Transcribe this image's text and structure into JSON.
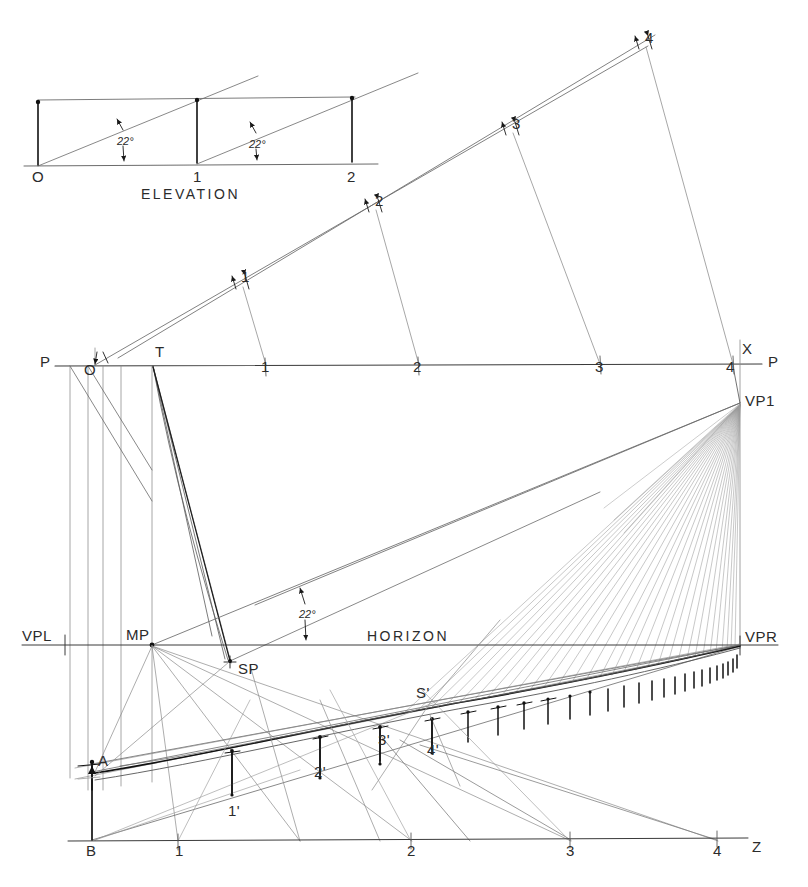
{
  "drawing": {
    "title": "Perspective construction – inclined plane",
    "line_color": "#3a3a3a",
    "heavy_color": "#111111",
    "light_color": "#8e8e8e",
    "background": "#ffffff"
  },
  "elevation": {
    "caption": "ELEVATION",
    "base_points": [
      "O",
      "1",
      "2"
    ],
    "angle_labels": [
      "22°",
      "22°"
    ],
    "angle_value": 22,
    "units": "degrees",
    "ground_y": 166,
    "top_y": 100,
    "x_positions": [
      38,
      197,
      352
    ]
  },
  "picture_plane": {
    "left_label": "P",
    "right_label": "P",
    "station_label": "X",
    "tick_labels": [
      "1",
      "2",
      "3",
      "4"
    ],
    "tick_x": [
      265,
      418,
      600,
      733
    ],
    "y": 365
  },
  "horizon": {
    "label": "HORIZON",
    "left_vp_label": "VPL",
    "right_vp_label": "VPR",
    "measuring_point_label": "MP",
    "station_point_label": "SP",
    "vanishing_point_label": "VP1",
    "angle_label": "22°",
    "y": 645
  },
  "ground_line": {
    "origin_label": "B",
    "right_label": "Z",
    "tick_labels": [
      "1",
      "2",
      "3",
      "4"
    ],
    "tick_x": [
      178,
      411,
      570,
      717
    ],
    "y": 840
  },
  "points": {
    "top_incline": [
      "1",
      "2",
      "3",
      "4"
    ],
    "true_height_base": "A",
    "true_height_foot": "B",
    "origin_plan": "O",
    "apex": "T",
    "primed": [
      "1'",
      "2'",
      "3'",
      "4'"
    ],
    "surface_point": "S'"
  },
  "labels": [
    {
      "name": "elev-O",
      "text": "O",
      "x": 32,
      "y": 168,
      "size": "normal"
    },
    {
      "name": "elev-1",
      "text": "1",
      "x": 193,
      "y": 168,
      "size": "normal"
    },
    {
      "name": "elev-2",
      "text": "2",
      "x": 347,
      "y": 168,
      "size": "normal"
    },
    {
      "name": "elev-angle-1",
      "text": "22°",
      "x": 117,
      "y": 135,
      "size": "ang"
    },
    {
      "name": "elev-angle-2",
      "text": "22°",
      "x": 249,
      "y": 138,
      "size": "ang"
    },
    {
      "name": "elevation-caption",
      "text": "ELEVATION",
      "x": 141,
      "y": 186,
      "size": "wide"
    },
    {
      "name": "incline-1",
      "text": "1",
      "x": 241,
      "y": 268,
      "size": "normal"
    },
    {
      "name": "incline-2",
      "text": "2",
      "x": 375,
      "y": 192,
      "size": "normal"
    },
    {
      "name": "incline-3",
      "text": "3",
      "x": 512,
      "y": 115,
      "size": "normal"
    },
    {
      "name": "incline-4",
      "text": "4",
      "x": 645,
      "y": 29,
      "size": "normal"
    },
    {
      "name": "pp-left-P",
      "text": "P",
      "x": 40,
      "y": 353,
      "size": "normal"
    },
    {
      "name": "pp-right-P",
      "text": "P",
      "x": 768,
      "y": 353,
      "size": "normal"
    },
    {
      "name": "pp-X",
      "text": "X",
      "x": 742,
      "y": 340,
      "size": "normal"
    },
    {
      "name": "pp-O",
      "text": "O",
      "x": 84,
      "y": 361,
      "size": "normal"
    },
    {
      "name": "pp-T",
      "text": "T",
      "x": 155,
      "y": 343,
      "size": "normal"
    },
    {
      "name": "pp-tick-1",
      "text": "1",
      "x": 261,
      "y": 358,
      "size": "normal"
    },
    {
      "name": "pp-tick-2",
      "text": "2",
      "x": 413,
      "y": 358,
      "size": "normal"
    },
    {
      "name": "pp-tick-3",
      "text": "3",
      "x": 595,
      "y": 358,
      "size": "normal"
    },
    {
      "name": "pp-tick-4",
      "text": "4",
      "x": 726,
      "y": 358,
      "size": "normal"
    },
    {
      "name": "vp1",
      "text": "VP1",
      "x": 745,
      "y": 392,
      "size": "normal"
    },
    {
      "name": "vpl",
      "text": "VPL",
      "x": 22,
      "y": 627,
      "size": "normal"
    },
    {
      "name": "vpr",
      "text": "VPR",
      "x": 745,
      "y": 628,
      "size": "normal"
    },
    {
      "name": "mp",
      "text": "MP",
      "x": 126,
      "y": 626,
      "size": "normal"
    },
    {
      "name": "sp",
      "text": "SP",
      "x": 238,
      "y": 660,
      "size": "normal"
    },
    {
      "name": "horizon-text",
      "text": "HORIZON",
      "x": 367,
      "y": 628,
      "size": "wide"
    },
    {
      "name": "horizon-angle",
      "text": "22°",
      "x": 299,
      "y": 608,
      "size": "ang"
    },
    {
      "name": "s-prime",
      "text": "S'",
      "x": 416,
      "y": 684,
      "size": "normal"
    },
    {
      "name": "pt-4-prime",
      "text": "4'",
      "x": 427,
      "y": 741,
      "size": "normal"
    },
    {
      "name": "pt-3-prime",
      "text": "3'",
      "x": 378,
      "y": 731,
      "size": "normal"
    },
    {
      "name": "pt-2-prime",
      "text": "2'",
      "x": 314,
      "y": 763,
      "size": "normal"
    },
    {
      "name": "pt-1-prime",
      "text": "1'",
      "x": 228,
      "y": 802,
      "size": "normal"
    },
    {
      "name": "pt-A",
      "text": "A",
      "x": 98,
      "y": 752,
      "size": "normal"
    },
    {
      "name": "pt-B",
      "text": "B",
      "x": 86,
      "y": 842,
      "size": "normal"
    },
    {
      "name": "gl-tick-1",
      "text": "1",
      "x": 175,
      "y": 842,
      "size": "normal"
    },
    {
      "name": "gl-tick-2",
      "text": "2",
      "x": 407,
      "y": 842,
      "size": "normal"
    },
    {
      "name": "gl-tick-3",
      "text": "3",
      "x": 566,
      "y": 842,
      "size": "normal"
    },
    {
      "name": "gl-tick-4",
      "text": "4",
      "x": 713,
      "y": 842,
      "size": "normal"
    },
    {
      "name": "gl-Z",
      "text": "Z",
      "x": 752,
      "y": 838,
      "size": "normal"
    }
  ]
}
